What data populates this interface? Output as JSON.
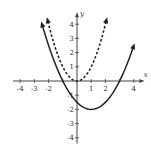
{
  "chart_data": {
    "type": "line",
    "title": "",
    "xlabel": "x",
    "ylabel": "y",
    "xlim": [
      -4.5,
      4.5
    ],
    "ylim": [
      -4.5,
      4.8
    ],
    "x_ticks": [
      -4,
      -3,
      -2,
      -1,
      1,
      2,
      3,
      4
    ],
    "x_tick_labels": [
      "-4",
      "-3",
      "-2",
      "1",
      "2",
      "4"
    ],
    "y_ticks": [
      -4,
      -3,
      -2,
      -1,
      1,
      2,
      3,
      4
    ],
    "y_tick_labels": [
      "4",
      "3",
      "2",
      "1",
      "-1",
      "-2",
      "-3",
      "-4"
    ],
    "grid": false,
    "series": [
      {
        "name": "y = x^2",
        "style": "dashed",
        "equation": "y = x^2",
        "vertex": [
          0,
          0
        ],
        "x": [
          -2.1,
          -2,
          -1,
          0,
          1,
          2,
          2.1
        ],
        "y": [
          4.41,
          4,
          1,
          0,
          1,
          4,
          4.41
        ]
      },
      {
        "name": "y = 0.5(x-1)^2 - 2",
        "style": "solid",
        "equation": "y = 0.5(x-1)^2 - 2",
        "vertex": [
          1,
          -2
        ],
        "x": [
          -2.5,
          -1,
          0,
          1,
          2,
          3,
          4
        ],
        "y": [
          4.125,
          0,
          -1.5,
          -2,
          -1.5,
          0,
          2.5
        ]
      }
    ]
  },
  "labels": {
    "x_axis": "x",
    "y_axis": "y"
  }
}
